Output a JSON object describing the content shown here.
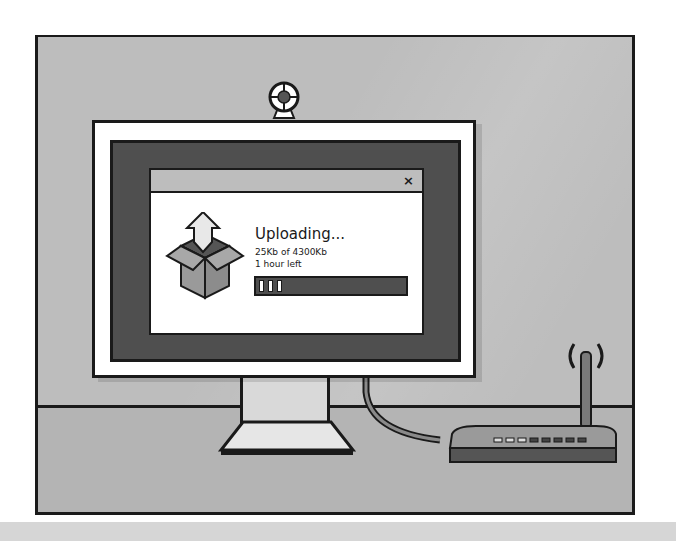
{
  "illustration": {
    "subject": "computer-monitor-upload-dialog",
    "dialog": {
      "close_label": "×",
      "title": "Uploading...",
      "size_status": "25Kb of 4300Kb",
      "time_remaining": "1 hour left",
      "progress_segments": 3
    },
    "colors": {
      "wall": "#bdbdbd",
      "screen": "#4f4f4f",
      "outline": "#1a1a1a",
      "frame": "#ffffff",
      "box": "#9a9a9a"
    }
  }
}
